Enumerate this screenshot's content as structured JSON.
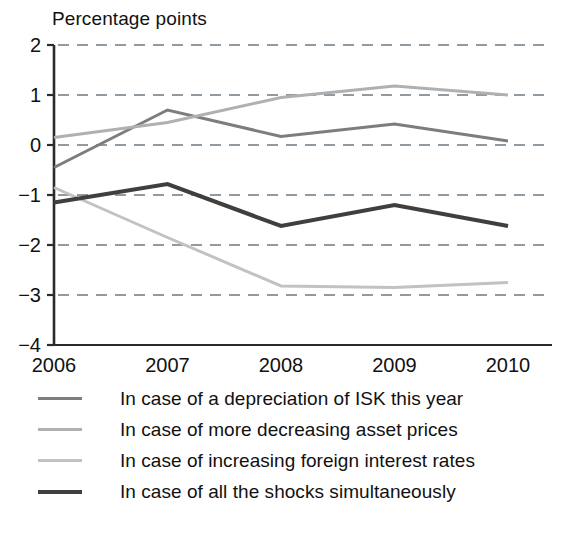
{
  "chart_data": {
    "type": "line",
    "title": "Percentage points",
    "xlabel": "",
    "ylabel": "",
    "x": [
      2006,
      2007,
      2008,
      2009,
      2010
    ],
    "categories": [
      "2006",
      "2007",
      "2008",
      "2009",
      "2010"
    ],
    "xticklabels": [
      "2006",
      "2007",
      "2008",
      "2009",
      "2010"
    ],
    "yticklabels": [
      "2",
      "1",
      "0",
      "−1",
      "−2",
      "−3",
      "−4"
    ],
    "yticks": [
      2,
      1,
      0,
      -1,
      -2,
      -3,
      -4
    ],
    "ylim": [
      -4,
      2
    ],
    "xlim": [
      2006,
      2010
    ],
    "grid": "horizontal-dashed",
    "legend_position": "below",
    "series": [
      {
        "name": "In case of a depreciation of ISK this year",
        "values": [
          -0.45,
          0.7,
          0.17,
          0.42,
          0.08
        ],
        "color": "#7d7d7d",
        "width": 3
      },
      {
        "name": "In case of more decreasing asset prices",
        "values": [
          0.15,
          0.45,
          0.95,
          1.18,
          1.0
        ],
        "color": "#b0b0b0",
        "width": 3
      },
      {
        "name": "In case of increasing foreign interest rates",
        "values": [
          -0.85,
          -1.85,
          -2.82,
          -2.85,
          -2.75
        ],
        "color": "#c2c2c2",
        "width": 3
      },
      {
        "name": "In case of all the shocks simultaneously",
        "values": [
          -1.15,
          -0.78,
          -1.62,
          -1.2,
          -1.62
        ],
        "color": "#3f3f3f",
        "width": 4
      }
    ]
  },
  "legend": {
    "items": [
      {
        "label": "In case of a depreciation of ISK this year",
        "color": "#7d7d7d"
      },
      {
        "label": "In case of more decreasing asset prices",
        "color": "#b0b0b0"
      },
      {
        "label": "In case of increasing foreign interest rates",
        "color": "#c2c2c2"
      },
      {
        "label": "In case of all the shocks simultaneously",
        "color": "#3f3f3f"
      }
    ]
  },
  "axis": {
    "color": "#2b2b2b",
    "gridline_color": "#8f9aa3"
  }
}
